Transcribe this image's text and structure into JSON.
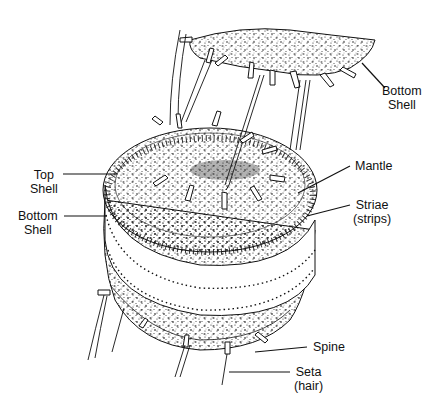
{
  "diagram": {
    "labels": [
      {
        "id": "bottom-shell-top",
        "lines": [
          "Bottom",
          "Shell"
        ]
      },
      {
        "id": "mantle",
        "lines": [
          "Mantle"
        ]
      },
      {
        "id": "striae",
        "lines": [
          "Striae",
          "(strips)"
        ]
      },
      {
        "id": "top-shell",
        "lines": [
          "Top",
          "Shell"
        ]
      },
      {
        "id": "bottom-shell-left",
        "lines": [
          "Bottom",
          "Shell"
        ]
      },
      {
        "id": "spine",
        "lines": [
          "Spine"
        ]
      },
      {
        "id": "seta",
        "lines": [
          "Seta",
          "(hair)"
        ]
      }
    ],
    "colors": {
      "ink": "#111111",
      "background": "#ffffff"
    }
  }
}
